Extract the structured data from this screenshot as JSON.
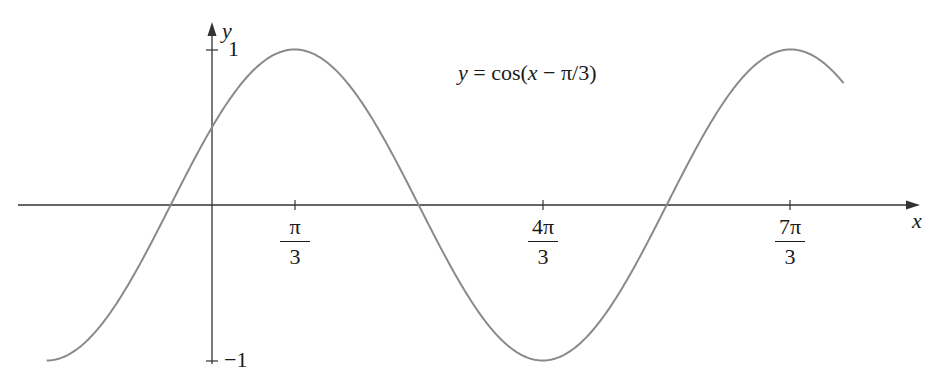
{
  "chart_data": {
    "type": "line",
    "title": "y = cos(x − π/3)",
    "function": "cos(x - pi/3)",
    "xlabel": "x",
    "ylabel": "y",
    "x_tick_labels": [
      {
        "num": "π",
        "den": "3",
        "value": 1.0472
      },
      {
        "num": "4π",
        "den": "3",
        "value": 4.1888
      },
      {
        "num": "7π",
        "den": "3",
        "value": 7.3304
      }
    ],
    "y_tick_labels": [
      {
        "label": "1",
        "value": 1
      },
      {
        "label": "−1",
        "value": -1
      }
    ],
    "xlim": [
      -2.0944,
      8.0
    ],
    "ylim": [
      -1,
      1
    ],
    "grid": false,
    "legend": "none",
    "series": [
      {
        "name": "y = cos(x − π/3)",
        "x": [
          -2.0944,
          -1.0472,
          -0.5236,
          0,
          1.0472,
          2.618,
          4.1888,
          5.7596,
          7.3304,
          8.0
        ],
        "values": [
          -1,
          -0.5,
          0,
          0.5,
          1,
          0,
          -1,
          0,
          1,
          0.78
        ]
      }
    ],
    "colors": {
      "curve": "#8a8a8a",
      "axes": "#333333"
    }
  },
  "annotation": {
    "lhs": "y",
    "rhs_prefix": " = cos(",
    "rhs_var": "x",
    "rhs_suffix": " − π/3)"
  },
  "axes": {
    "x_label": "x",
    "y_label": "y"
  }
}
